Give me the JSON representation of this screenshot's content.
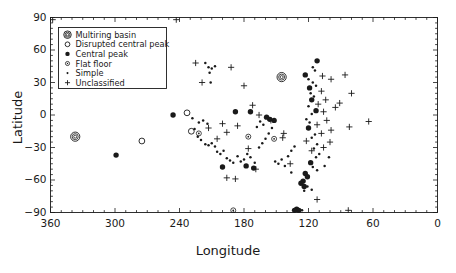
{
  "chart_data": {
    "type": "scatter",
    "title": "",
    "xlabel": "Longitude",
    "ylabel": "Latitude",
    "xlim": [
      360,
      0
    ],
    "ylim": [
      -90,
      90
    ],
    "x_ticks": [
      360,
      300,
      240,
      180,
      120,
      60,
      0
    ],
    "y_ticks": [
      90,
      60,
      30,
      0,
      -30,
      -60,
      -90
    ],
    "x_axis_reversed": true,
    "grid": false,
    "minor_ticks": true,
    "legend_position": "upper-left-inside",
    "legend": [
      {
        "key": "multiring",
        "label": "Multiring basin",
        "marker": "concentric-circles"
      },
      {
        "key": "disrupted",
        "label": "Disrupted central peak",
        "marker": "open-circle"
      },
      {
        "key": "central",
        "label": "Central peak",
        "marker": "filled-circle-large"
      },
      {
        "key": "flatfloor",
        "label": "Flat floor",
        "marker": "dotted-circle"
      },
      {
        "key": "simple",
        "label": "Simple",
        "marker": "small-dot"
      },
      {
        "key": "unclassified",
        "label": "Unclassified",
        "marker": "plus"
      }
    ],
    "series": [
      {
        "name": "Multiring basin",
        "key": "multiring",
        "points": [
          [
            337,
            -20
          ],
          [
            145,
            35
          ]
        ]
      },
      {
        "name": "Disrupted central peak",
        "key": "disrupted",
        "points": [
          [
            275,
            -24
          ],
          [
            233,
            2
          ],
          [
            229,
            -15
          ]
        ]
      },
      {
        "name": "Central peak",
        "key": "central",
        "points": [
          [
            299,
            -37
          ],
          [
            246,
            0
          ],
          [
            188,
            3
          ],
          [
            174,
            3
          ],
          [
            159,
            -2
          ],
          [
            156,
            -4
          ],
          [
            152,
            -5
          ],
          [
            112,
            50
          ],
          [
            123,
            37
          ],
          [
            119,
            25
          ],
          [
            117,
            14
          ],
          [
            113,
            4
          ],
          [
            120,
            -12
          ],
          [
            118,
            -44
          ],
          [
            123,
            -54
          ],
          [
            121,
            -57
          ],
          [
            125,
            -61
          ],
          [
            127,
            -63
          ],
          [
            124,
            -66
          ],
          [
            200,
            -48
          ],
          [
            178,
            -47
          ],
          [
            171,
            -49
          ],
          [
            131,
            -87
          ],
          [
            129,
            -88
          ],
          [
            133,
            -88
          ]
        ]
      },
      {
        "name": "Flat floor",
        "key": "flatfloor",
        "points": [
          [
            222,
            -17
          ],
          [
            176,
            -20
          ],
          [
            152,
            -22
          ],
          [
            190,
            -88
          ]
        ]
      },
      {
        "name": "Simple",
        "key": "simple",
        "points": [
          [
            216,
            48
          ],
          [
            213,
            44
          ],
          [
            210,
            43
          ],
          [
            207,
            45
          ],
          [
            212,
            39
          ],
          [
            211,
            30
          ],
          [
            228,
            -3
          ],
          [
            222,
            -7
          ],
          [
            218,
            -5
          ],
          [
            214,
            -8
          ],
          [
            226,
            -13
          ],
          [
            223,
            -20
          ],
          [
            220,
            -23
          ],
          [
            216,
            -27
          ],
          [
            213,
            -28
          ],
          [
            210,
            -26
          ],
          [
            207,
            -29
          ],
          [
            205,
            -34
          ],
          [
            202,
            -36
          ],
          [
            199,
            -33
          ],
          [
            196,
            -40
          ],
          [
            193,
            -42
          ],
          [
            190,
            -44
          ],
          [
            186,
            -38
          ],
          [
            183,
            -43
          ],
          [
            180,
            -41
          ],
          [
            177,
            -36
          ],
          [
            174,
            -39
          ],
          [
            170,
            -44
          ],
          [
            166,
            -30
          ],
          [
            163,
            -26
          ],
          [
            160,
            -22
          ],
          [
            157,
            -17
          ],
          [
            154,
            -12
          ],
          [
            165,
            -6
          ],
          [
            162,
            -9
          ],
          [
            168,
            -11
          ],
          [
            151,
            -43
          ],
          [
            148,
            -45
          ],
          [
            145,
            -41
          ],
          [
            142,
            -47
          ],
          [
            139,
            -38
          ],
          [
            136,
            -33
          ],
          [
            133,
            -29
          ],
          [
            116,
            44
          ],
          [
            114,
            41
          ],
          [
            120,
            33
          ],
          [
            116,
            30
          ],
          [
            113,
            27
          ],
          [
            118,
            20
          ],
          [
            115,
            17
          ],
          [
            120,
            8
          ],
          [
            117,
            1
          ],
          [
            122,
            -4
          ],
          [
            119,
            -7
          ],
          [
            114,
            -18
          ],
          [
            117,
            -21
          ],
          [
            112,
            -27
          ],
          [
            115,
            -31
          ],
          [
            110,
            -36
          ],
          [
            113,
            -39
          ],
          [
            116,
            -48
          ],
          [
            112,
            -51
          ],
          [
            121,
            -66
          ],
          [
            117,
            -69
          ],
          [
            124,
            -70
          ],
          [
            105,
            -47
          ],
          [
            101,
            -39
          ],
          [
            136,
            -53
          ],
          [
            126,
            -88
          ]
        ]
      },
      {
        "name": "Unclassified",
        "key": "unclassified",
        "points": [
          [
            225,
            48
          ],
          [
            192,
            44
          ],
          [
            219,
            30
          ],
          [
            180,
            27
          ],
          [
            172,
            9
          ],
          [
            166,
            0
          ],
          [
            155,
            -5
          ],
          [
            200,
            -8
          ],
          [
            186,
            -10
          ],
          [
            196,
            -16
          ],
          [
            143,
            -17
          ],
          [
            213,
            -12
          ],
          [
            205,
            -22
          ],
          [
            176,
            -31
          ],
          [
            169,
            -50
          ],
          [
            196,
            -58
          ],
          [
            188,
            -59
          ],
          [
            144,
            -21
          ],
          [
            137,
            -45
          ],
          [
            107,
            36
          ],
          [
            99,
            33
          ],
          [
            86,
            37
          ],
          [
            80,
            20
          ],
          [
            108,
            22
          ],
          [
            104,
            14
          ],
          [
            95,
            7
          ],
          [
            91,
            11
          ],
          [
            111,
            10
          ],
          [
            106,
            3
          ],
          [
            103,
            -5
          ],
          [
            112,
            -9
          ],
          [
            99,
            -14
          ],
          [
            108,
            -17
          ],
          [
            117,
            -33
          ],
          [
            106,
            -30
          ],
          [
            100,
            -25
          ],
          [
            122,
            -24
          ],
          [
            64,
            -6
          ],
          [
            82,
            -11
          ],
          [
            112,
            -78
          ],
          [
            83,
            -88
          ],
          [
            362,
            -62
          ],
          [
            358,
            88
          ],
          [
            243,
            88
          ]
        ]
      }
    ]
  }
}
